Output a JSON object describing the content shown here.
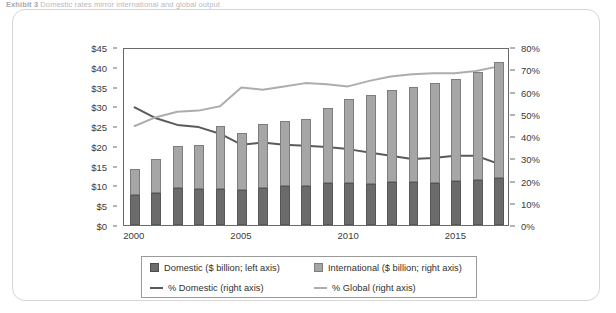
{
  "caption": {
    "prefix": "Exhibit 3",
    "text": "Domestic rates mirror international and global output"
  },
  "chart_data": {
    "type": "bar",
    "title": "",
    "subtitle": "",
    "xlabel": "",
    "ylabel": "",
    "y2label": "",
    "grid": false,
    "legend_position": "bottom",
    "x": [
      2000,
      2001,
      2002,
      2003,
      2004,
      2005,
      2006,
      2007,
      2008,
      2009,
      2010,
      2011,
      2012,
      2013,
      2014,
      2015,
      2016,
      2017
    ],
    "x_tick_labels": [
      "2000",
      "2005",
      "2010",
      "2015"
    ],
    "x_tick_values": [
      2000,
      2005,
      2010,
      2015
    ],
    "ylim": [
      0,
      45
    ],
    "y_tick_labels": [
      "$0",
      "$5",
      "$10",
      "$15",
      "$20",
      "$25",
      "$30",
      "$35",
      "$40",
      "$45"
    ],
    "y_tick_values": [
      0,
      5,
      10,
      15,
      20,
      25,
      30,
      35,
      40,
      45
    ],
    "y2lim": [
      0,
      80
    ],
    "y2_tick_labels": [
      "0%",
      "10%",
      "20%",
      "30%",
      "40%",
      "50%",
      "60%",
      "70%",
      "80%"
    ],
    "y2_tick_values": [
      0,
      10,
      20,
      30,
      40,
      50,
      60,
      70,
      80
    ],
    "series": [
      {
        "name": "Domestic ($ billion; left axis)",
        "type": "bar-stack",
        "color": "#6b6b6b",
        "axis": "left",
        "values": [
          7.7,
          8.1,
          9.3,
          9.2,
          9.2,
          8.8,
          9.3,
          9.8,
          9.8,
          10.6,
          10.6,
          10.3,
          10.8,
          10.9,
          10.7,
          11.1,
          11.5,
          11.9
        ]
      },
      {
        "name": "International ($ billion; right axis)",
        "type": "bar-stack",
        "color": "#a6a6a6",
        "axis": "left",
        "values": [
          6.5,
          8.6,
          10.6,
          11.0,
          15.9,
          14.5,
          16.3,
          16.6,
          17.1,
          19.1,
          21.3,
          22.6,
          23.4,
          24.0,
          25.3,
          25.9,
          27.2,
          29.3
        ]
      },
      {
        "name": "% Domestic (right axis)",
        "type": "line",
        "color": "#5a5a5a",
        "axis": "right",
        "values": [
          53.5,
          48.5,
          45.5,
          44.5,
          41.5,
          36.5,
          37.5,
          36.5,
          36.0,
          35.5,
          34.5,
          33.0,
          31.5,
          30.0,
          30.5,
          31.5,
          31.5,
          28.0
        ]
      },
      {
        "name": "% Global (right axis)",
        "type": "line",
        "color": "#adadad",
        "axis": "right",
        "values": [
          45.0,
          49.0,
          51.5,
          52.0,
          54.0,
          62.5,
          61.5,
          63.0,
          64.5,
          64.0,
          63.0,
          65.5,
          67.5,
          68.5,
          69.0,
          69.0,
          70.0,
          72.0
        ]
      }
    ],
    "totals": [
      14.2,
      16.7,
      19.9,
      20.2,
      25.1,
      23.3,
      25.6,
      26.4,
      26.9,
      29.7,
      31.9,
      32.9,
      34.2,
      34.9,
      36.0,
      37.0,
      38.7,
      41.2
    ]
  },
  "legend": {
    "items": [
      {
        "label": "Domestic ($ billion; left axis)",
        "marker": "square",
        "color": "#6b6b6b"
      },
      {
        "label": "International ($ billion; right axis)",
        "marker": "square",
        "color": "#a6a6a6"
      },
      {
        "label": "% Domestic (right axis)",
        "marker": "line",
        "color": "#5a5a5a"
      },
      {
        "label": "% Global (right axis)",
        "marker": "line",
        "color": "#adadad"
      }
    ]
  },
  "colors": {
    "domestic": "#6b6b6b",
    "international": "#a6a6a6",
    "pct_domestic": "#5a5a5a",
    "pct_global": "#adadad",
    "axis": "#6a6a6a",
    "panel_border": "#d6d6d9"
  }
}
